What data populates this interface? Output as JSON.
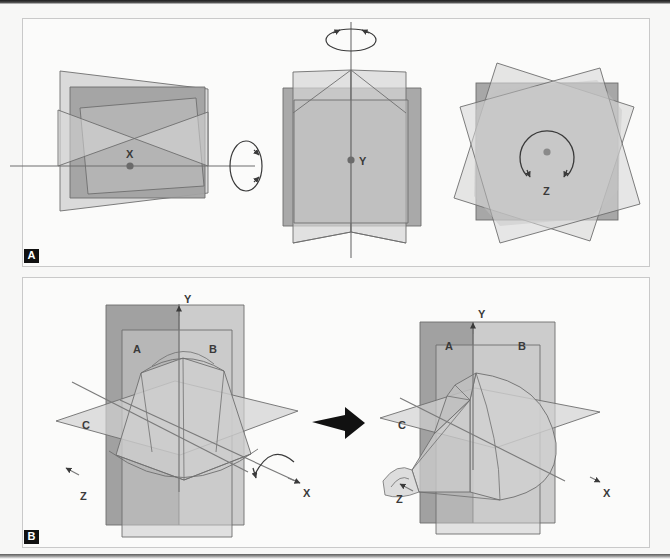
{
  "figure": {
    "panels": [
      {
        "id": "A",
        "label": "A",
        "caption_letter": "A",
        "description": "Rotation of a planar object about the three cardinal axes",
        "subfigures": [
          {
            "name": "x-rotation",
            "axis_label": "X",
            "rotation_indicator": "vertical-ellipse-two-arrowheads",
            "axis_orientation": "horizontal"
          },
          {
            "name": "y-rotation",
            "axis_label": "Y",
            "rotation_indicator": "horizontal-ellipse-two-arrowheads",
            "axis_orientation": "vertical"
          },
          {
            "name": "z-rotation",
            "axis_label": "Z",
            "rotation_indicator": "circle-two-arrowheads",
            "axis_orientation": "out-of-plane"
          }
        ]
      },
      {
        "id": "B",
        "label": "B",
        "caption_letter": "B",
        "description": "Three orthogonal symmetry planes bounding a dome-shaped solid and its quarter cut-away",
        "transition_icon": "right-arrow",
        "subfigures": [
          {
            "name": "full-solid",
            "axes": [
              "X",
              "Y",
              "Z"
            ],
            "planes": [
              "A",
              "B",
              "C"
            ],
            "rotation_indicator": "curved-arrow-about-x"
          },
          {
            "name": "cutaway-solid",
            "axes": [
              "X",
              "Y",
              "Z"
            ],
            "planes": [
              "A",
              "B",
              "C"
            ],
            "rotation_indicator": "none"
          }
        ]
      }
    ],
    "axis_labels": {
      "x": "X",
      "y": "Y",
      "z": "Z"
    },
    "plane_labels": {
      "a": "A",
      "b": "B",
      "c": "C"
    },
    "colors": {
      "background": "#f7f7f6",
      "panel_fill": "#fbfbfa",
      "panel_border": "#c9c9c9",
      "plane_dark": "#9a9a9a",
      "plane_mid": "#b4b4b4",
      "plane_light": "#cfcfcf",
      "plane_pale": "#dcdcdc",
      "stroke": "#6e6e6e",
      "ink": "#3a3a3a",
      "label_box": "#111111",
      "label_text": "#ffffff"
    }
  }
}
